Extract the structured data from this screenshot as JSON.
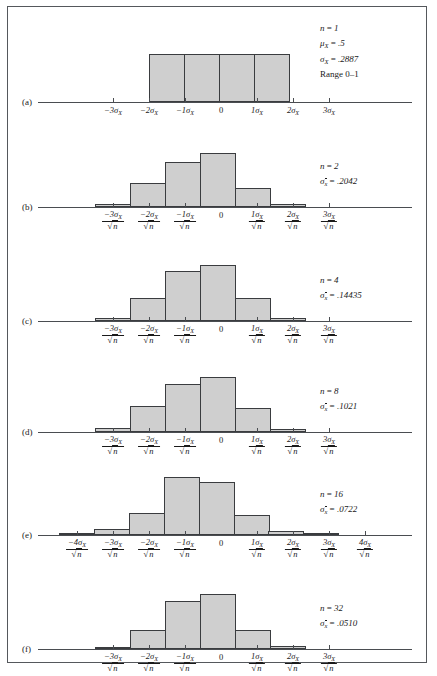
{
  "figure": {
    "bar_fill": "#cfcfcf",
    "bar_stroke": "#3a3c3f",
    "axis_color": "#4a4d51",
    "frame_color": "#55585c"
  },
  "chart_data": {
    "type": "bar",
    "title": "",
    "xlabel": "",
    "ylabel": "",
    "panels": [
      {
        "id": "a",
        "label": "(a)",
        "axis_unit": "sigma_X",
        "annotation": [
          {
            "text": "n = 1",
            "style": "italic-n"
          },
          {
            "text": "μX = .5"
          },
          {
            "text": "σX = .2887"
          },
          {
            "text": "Range 0–1",
            "style": "roman"
          }
        ],
        "annotation_lines": [
          "n = 1",
          "μ_X = .5",
          "σ_X = .2887",
          "Range 0–1"
        ],
        "n": 1,
        "sigma": 0.2887,
        "mu": 0.5,
        "range": "0–1",
        "ticks": [
          "-3",
          "-2",
          "-1",
          "0",
          "1",
          "2",
          "3"
        ],
        "tick_has_fraction": false,
        "bar_start_tick": -2,
        "bar_width_sigma": 1,
        "values": [
          1,
          1,
          1,
          1
        ],
        "peak_px": 48
      },
      {
        "id": "b",
        "label": "(b)",
        "axis_unit": "sigma_X_over_sqrt_n",
        "annotation_lines": [
          "n = 2",
          "σ_x̄ = .2042"
        ],
        "n": 2,
        "sigma": 0.2042,
        "ticks": [
          "-3",
          "-2",
          "-1",
          "0",
          "1",
          "2",
          "3"
        ],
        "tick_has_fraction": true,
        "bar_start_sigma": -3.5,
        "bar_width_sigma": 1,
        "values": [
          0.05,
          0.42,
          0.78,
          0.93,
          0.33,
          0.05
        ],
        "peak_px": 58
      },
      {
        "id": "c",
        "label": "(c)",
        "axis_unit": "sigma_X_over_sqrt_n",
        "annotation_lines": [
          "n = 4",
          "σ_x̄ = .14435"
        ],
        "n": 4,
        "sigma": 0.14435,
        "ticks": [
          "-3",
          "-2",
          "-1",
          "0",
          "1",
          "2",
          "3"
        ],
        "tick_has_fraction": true,
        "bar_start_sigma": -3.5,
        "bar_width_sigma": 1,
        "values": [
          0.06,
          0.4,
          0.87,
          0.96,
          0.4,
          0.06
        ],
        "peak_px": 58
      },
      {
        "id": "d",
        "label": "(d)",
        "axis_unit": "sigma_X_over_sqrt_n",
        "annotation_lines": [
          "n = 8",
          "σ_x̄ = .1021"
        ],
        "n": 8,
        "sigma": 0.1021,
        "ticks": [
          "-3",
          "-2",
          "-1",
          "0",
          "1",
          "2",
          "3"
        ],
        "tick_has_fraction": true,
        "bar_start_sigma": -3.5,
        "bar_width_sigma": 1,
        "values": [
          0.07,
          0.44,
          0.82,
          0.95,
          0.42,
          0.06
        ],
        "peak_px": 58
      },
      {
        "id": "e",
        "label": "(e)",
        "axis_unit": "sigma_X_over_sqrt_n",
        "annotation_lines": [
          "n = 16",
          "σ_x̄ = .0722"
        ],
        "n": 16,
        "sigma": 0.0722,
        "ticks": [
          "-4",
          "-3",
          "-2",
          "-1",
          "0",
          "1",
          "2",
          "3",
          "4"
        ],
        "tick_has_fraction": true,
        "bar_start_sigma": -4.5,
        "bar_width_sigma": 1,
        "values": [
          0.04,
          0.09,
          0.36,
          0.93,
          0.86,
          0.33,
          0.06,
          0.04
        ],
        "peak_px": 62
      },
      {
        "id": "f",
        "label": "(f)",
        "axis_unit": "sigma_X_over_sqrt_n",
        "annotation_lines": [
          "n = 32",
          "σ_x̄ = .0510"
        ],
        "n": 32,
        "sigma": 0.051,
        "ticks": [
          "-3",
          "-2",
          "-1",
          "0",
          "1",
          "2",
          "3"
        ],
        "tick_has_fraction": true,
        "bar_start_sigma": -3.5,
        "bar_width_sigma": 1,
        "values": [
          0.04,
          0.33,
          0.82,
          0.95,
          0.33,
          0.06
        ],
        "peak_px": 58
      }
    ]
  }
}
